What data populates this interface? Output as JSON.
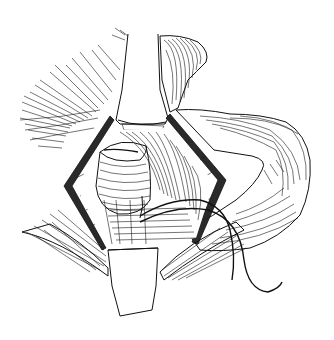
{
  "illustration": {
    "type": "surgical line drawing",
    "style": "black ink hatching on white",
    "background": "#ffffff",
    "ink": "#111111",
    "elements": [
      "upper-retractor-blade",
      "lower-retractor-blade",
      "diamond-incision-frame",
      "exposed-organ-tissue",
      "left-fan-muscle-fibers",
      "right-muscle-mass",
      "lower-left-muscle-flap",
      "lower-right-muscle-flap",
      "suture-thread"
    ]
  }
}
